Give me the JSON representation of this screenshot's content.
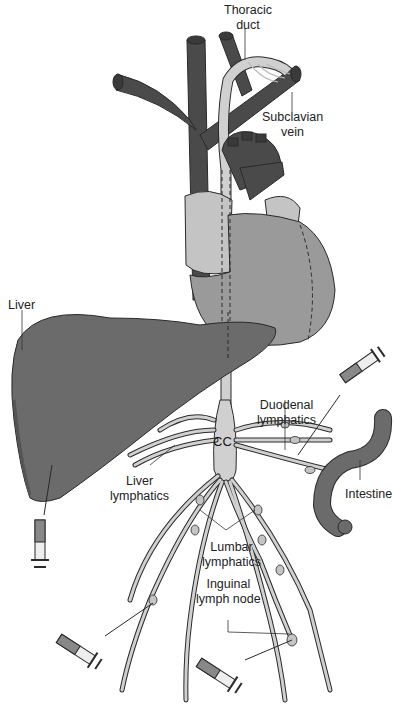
{
  "diagram": {
    "labels": {
      "thoracic_duct": [
        "Thoracic",
        "duct"
      ],
      "subclavian_vein": [
        "Subclavian",
        "vein"
      ],
      "liver": "Liver",
      "duodenal_lymphatics": [
        "Duodenal",
        "lymphatics"
      ],
      "cc": "CC",
      "liver_lymphatics": [
        "Liver",
        "lymphatics"
      ],
      "intestine": "Intestine",
      "lumbar_lymphatics": [
        "Lumbar",
        "lymphatics"
      ],
      "inguinal_lymph_node": [
        "Inguinal",
        "lymph node"
      ]
    },
    "structures": [
      "heart",
      "superior vena cava",
      "brachiocephalic veins",
      "subclavian vein",
      "thoracic duct",
      "liver",
      "cisterna chyli (CC)",
      "intestine",
      "lymphatic vessels",
      "lymph nodes",
      "syringes (4)"
    ],
    "colors": {
      "vein_dark": "#4a4a4a",
      "organ_mid": "#6b6b6b",
      "heart_light": "#9a9a9a",
      "heart_pale": "#c4c4c4",
      "lymph": "#d0d0d0",
      "outline": "#2a2a2a",
      "background": "#ffffff"
    }
  }
}
